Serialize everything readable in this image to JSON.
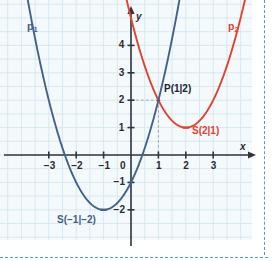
{
  "chart_data": {
    "type": "line",
    "title": "",
    "xlabel": "x",
    "ylabel": "y",
    "xlim": [
      -3.9,
      4.3
    ],
    "ylim": [
      -2.6,
      4.9
    ],
    "grid": true,
    "grid_step": 0.5,
    "xticks": [
      -3,
      -2,
      -1,
      0,
      1,
      2,
      3
    ],
    "yticks": [
      -2,
      -1,
      0,
      1,
      2,
      3,
      4
    ],
    "xtick_labels": [
      "-3",
      "-2",
      "-1",
      "0",
      "1",
      "2",
      "3"
    ],
    "ytick_labels": [
      "-2",
      "-1",
      "0",
      "1",
      "2",
      "3",
      "4"
    ],
    "series": [
      {
        "name": "p1",
        "label": "p",
        "label_sub": "1",
        "color": "#43618a",
        "equation_a": 1,
        "equation_h": -1,
        "equation_k": -2,
        "vertex": [
          -1,
          -2
        ],
        "vertex_label": "S(−1|−2)",
        "passes_through": [
          [
            0,
            -1
          ],
          [
            1,
            2
          ],
          [
            -3,
            2
          ]
        ]
      },
      {
        "name": "p2",
        "label": "p",
        "label_sub": "2",
        "color": "#e0432c",
        "equation_a": 1,
        "equation_h": 2,
        "equation_k": 1,
        "vertex": [
          2,
          1
        ],
        "vertex_label": "S(2|1)",
        "passes_through": [
          [
            1,
            2
          ],
          [
            3,
            2
          ],
          [
            0,
            5
          ]
        ]
      }
    ],
    "intersection": {
      "point": [
        1,
        2
      ],
      "label": "P(1|2)",
      "guides": true
    },
    "annotations": [
      {
        "name": "p1-label",
        "text": "p",
        "sub": "1",
        "x": -3.55,
        "y": 4.65,
        "color": "#43618a"
      },
      {
        "name": "p2-label",
        "text": "p",
        "sub": "2",
        "x": 3.65,
        "y": 4.65,
        "color": "#e0432c"
      },
      {
        "name": "intersection-label",
        "text": "P(1|2)",
        "x": 1.2,
        "y": 2.35,
        "color": "#1d2330"
      },
      {
        "name": "vertex2-label",
        "text": "S(2|1)",
        "x": 2.25,
        "y": 0.78,
        "color": "#e0432c"
      },
      {
        "name": "vertex1-label",
        "text": "S(−1|−2)",
        "x": -2.65,
        "y": -2.35,
        "color": "#43618a"
      }
    ]
  },
  "axes": {
    "x_axis_name": "x",
    "y_axis_name": "y",
    "origin_label": "0"
  },
  "colors": {
    "background": "#f4f9fb",
    "grid": "#d8e8f0",
    "axis": "#2f3540",
    "curve_1": "#43618a",
    "curve_2": "#e0432c",
    "border_dashed": "#4a9ed4"
  }
}
